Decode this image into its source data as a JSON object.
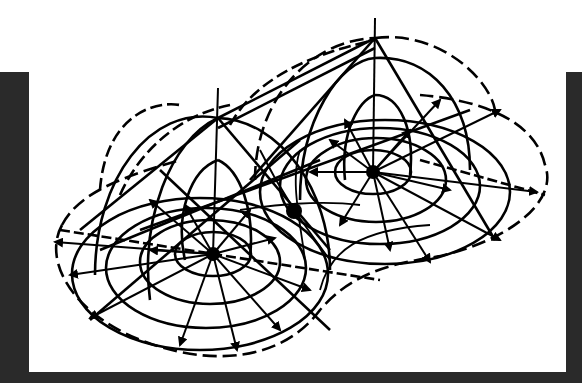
{
  "figure": {
    "colors": {
      "background": "#ffffff",
      "frame": "#2a2a2a",
      "ink": "#000000"
    },
    "sources": [
      {
        "name": "left-source",
        "cx": 213,
        "cy": 254
      },
      {
        "name": "right-source",
        "cx": 373,
        "cy": 172
      }
    ],
    "saddle_point": {
      "cx": 294,
      "cy": 211
    },
    "peaks": [
      {
        "name": "left-peak",
        "x": 218,
        "y": 118
      },
      {
        "name": "right-peak",
        "x": 375,
        "y": 38
      }
    ]
  }
}
